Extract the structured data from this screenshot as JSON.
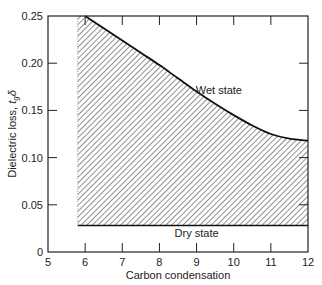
{
  "chart_data": {
    "type": "area",
    "title": "",
    "xlabel": "Carbon condensation",
    "ylabel": "Dielectric loss, t_g δ",
    "ylabel_main": "Dielectric loss, ",
    "ylabel_sym": "t",
    "ylabel_sub": "g",
    "ylabel_delta": "δ",
    "xlim": [
      5,
      12
    ],
    "ylim": [
      0,
      0.25
    ],
    "x_ticks": [
      "5",
      "6",
      "7",
      "8",
      "9",
      "10",
      "11",
      "12"
    ],
    "y_ticks": [
      "0",
      "0.05",
      "0.10",
      "0.15",
      "0.20",
      "0.25"
    ],
    "grid": false,
    "series": [
      {
        "name": "Wet state",
        "x": [
          6.0,
          6.5,
          7.0,
          7.5,
          8.0,
          8.5,
          9.0,
          9.5,
          10.0,
          10.5,
          11.0,
          11.5,
          12.0
        ],
        "values": [
          0.25,
          0.237,
          0.224,
          0.211,
          0.198,
          0.184,
          0.17,
          0.157,
          0.145,
          0.134,
          0.125,
          0.12,
          0.118
        ]
      },
      {
        "name": "Dry state",
        "x": [
          5.8,
          12.0
        ],
        "values": [
          0.028,
          0.028
        ]
      }
    ],
    "annotations": [
      {
        "text": "Wet state",
        "x": 9.6,
        "y": 0.172
      },
      {
        "text": "Dry state",
        "x": 9.0,
        "y": 0.02
      }
    ],
    "shaded_region": {
      "between": [
        "Dry state",
        "Wet state"
      ],
      "x_start": 5.8,
      "pattern": "diagonal-hatch"
    }
  }
}
